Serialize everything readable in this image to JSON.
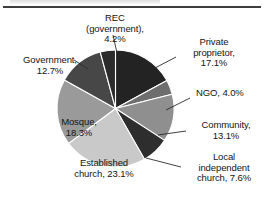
{
  "figure": {
    "top_rule": "divider",
    "caption_fragment": ""
  },
  "chart_data": {
    "type": "pie",
    "title": "",
    "xlabel": "",
    "ylabel": "",
    "legend_position": "none",
    "grid": false,
    "units": "percent",
    "start_angle_deg": 0,
    "direction": "clockwise",
    "categories": [
      "Private proprietor",
      "NGO",
      "Community",
      "Local independent church",
      "Established church",
      "Mosque",
      "Government",
      "REC (government)"
    ],
    "values": [
      17.1,
      4.0,
      13.1,
      7.6,
      23.1,
      18.3,
      12.7,
      4.2
    ],
    "colors": [
      "#232323",
      "#6e6e6e",
      "#8f8f8f",
      "#2e2e2e",
      "#c9c9c9",
      "#9a9a9a",
      "#474747",
      "#2b2b2b"
    ],
    "slices": [
      {
        "name": "Private proprietor",
        "value": 17.1,
        "label": "Private proprietor, 17.1%",
        "color": "#232323"
      },
      {
        "name": "NGO",
        "value": 4.0,
        "label": "NGO, 4.0%",
        "color": "#6e6e6e"
      },
      {
        "name": "Community",
        "value": 13.1,
        "label": "Community, 13.1%",
        "color": "#8f8f8f"
      },
      {
        "name": "Local independent church",
        "value": 7.6,
        "label": "Local independent church, 7.6%",
        "color": "#2e2e2e"
      },
      {
        "name": "Established church",
        "value": 23.1,
        "label": "Established church, 23.1%",
        "color": "#c9c9c9"
      },
      {
        "name": "Mosque",
        "value": 18.3,
        "label": "Mosque, 18.3%",
        "color": "#9a9a9a"
      },
      {
        "name": "Government",
        "value": 12.7,
        "label": "Government, 12.7%",
        "color": "#474747"
      },
      {
        "name": "REC (government)",
        "value": 4.2,
        "label": "REC (government), 4.2%",
        "color": "#2b2b2b"
      }
    ]
  },
  "labels": {
    "rec": {
      "line1": "REC",
      "line2": "(government),",
      "line3": "4.2%"
    },
    "private": {
      "line1": "Private",
      "line2": "proprietor,",
      "line3": "17.1%"
    },
    "ngo": {
      "line1": "NGO, 4.0%"
    },
    "community": {
      "line1": "Community,",
      "line2": "13.1%"
    },
    "localchurch": {
      "line1": "Local",
      "line2": "independent",
      "line3": "church, 7.6%"
    },
    "government": {
      "line1": "Government,",
      "line2": "12.7%"
    },
    "mosque": {
      "line1": "Mosque,",
      "line2": "18.3%"
    },
    "established": {
      "line1": "Established",
      "line2": "church, 23.1%"
    }
  }
}
